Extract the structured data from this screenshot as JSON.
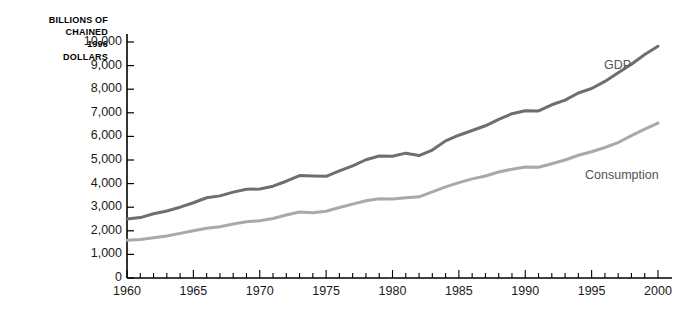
{
  "chart_data": {
    "type": "line",
    "title": "",
    "xlabel": "",
    "ylabel": "BILLIONS OF\nCHAINED\n1996\nDOLLARS",
    "ylabel_lines": [
      "BILLIONS OF",
      "CHAINED",
      "1996",
      "DOLLARS"
    ],
    "xlim": [
      1960,
      2000
    ],
    "ylim": [
      0,
      10000
    ],
    "grid": false,
    "legend_position": "inline-right",
    "x_tick_labels": [
      "1960",
      "1965",
      "1970",
      "1975",
      "1980",
      "1985",
      "1990",
      "1995",
      "2000"
    ],
    "x_major_ticks": [
      1960,
      1965,
      1970,
      1975,
      1980,
      1985,
      1990,
      1995,
      2000
    ],
    "x_minor_tick_step": 1,
    "y_tick_labels": [
      "0",
      "1,000",
      "2,000",
      "3,000",
      "4,000",
      "5,000",
      "6,000",
      "7,000",
      "8,000",
      "9,000",
      "10,000"
    ],
    "y_major_ticks": [
      0,
      1000,
      2000,
      3000,
      4000,
      5000,
      6000,
      7000,
      8000,
      9000,
      10000
    ],
    "x": [
      1960,
      1961,
      1962,
      1963,
      1964,
      1965,
      1966,
      1967,
      1968,
      1969,
      1970,
      1971,
      1972,
      1973,
      1974,
      1975,
      1976,
      1977,
      1978,
      1979,
      1980,
      1981,
      1982,
      1983,
      1984,
      1985,
      1986,
      1987,
      1988,
      1989,
      1990,
      1991,
      1992,
      1993,
      1994,
      1995,
      1996,
      1997,
      1998,
      1999,
      2000
    ],
    "series": [
      {
        "name": "GDP",
        "color": "#6e6e6e",
        "label_x": 2000,
        "values": [
          2500,
          2560,
          2720,
          2840,
          3000,
          3190,
          3400,
          3480,
          3640,
          3760,
          3770,
          3890,
          4100,
          4340,
          4320,
          4310,
          4540,
          4750,
          5010,
          5170,
          5160,
          5290,
          5190,
          5420,
          5810,
          6050,
          6250,
          6450,
          6720,
          6960,
          7090,
          7080,
          7340,
          7540,
          7840,
          8030,
          8330,
          8700,
          9060,
          9470,
          9820
        ]
      },
      {
        "name": "Consumption",
        "color": "#a9a9a9",
        "label_x": 2000,
        "values": [
          1600,
          1630,
          1710,
          1780,
          1890,
          2000,
          2110,
          2170,
          2290,
          2380,
          2430,
          2520,
          2670,
          2800,
          2760,
          2830,
          2990,
          3130,
          3270,
          3360,
          3350,
          3400,
          3440,
          3650,
          3860,
          4040,
          4200,
          4320,
          4490,
          4610,
          4700,
          4690,
          4840,
          5000,
          5200,
          5350,
          5530,
          5740,
          6030,
          6310,
          6560
        ]
      }
    ]
  }
}
